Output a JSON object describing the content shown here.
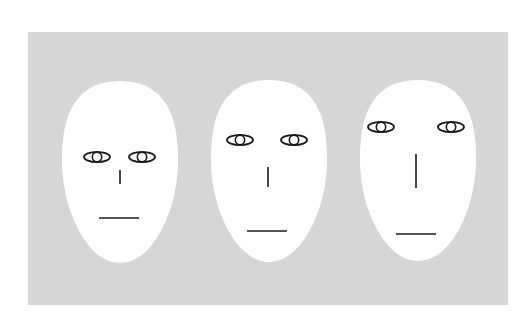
{
  "figure": {
    "background_color": "#ffffff",
    "panel": {
      "x": 28,
      "y": 32,
      "width": 480,
      "height": 273,
      "color": "#d6d6d6"
    },
    "face_color": "#ffffff",
    "stroke_color": "#1a1a1a",
    "faces": [
      {
        "id": "face-1",
        "head": {
          "cx": 120,
          "top": 81,
          "bottom": 263,
          "width": 118
        },
        "eyes": {
          "y": 157,
          "left_x": 97,
          "right_x": 142,
          "rx": 13,
          "ry": 5
        },
        "nose": {
          "x": 120,
          "y1": 170,
          "y2": 184
        },
        "mouth": {
          "y": 218,
          "x1": 99,
          "x2": 139
        }
      },
      {
        "id": "face-2",
        "head": {
          "cx": 269,
          "top": 80,
          "bottom": 262,
          "width": 118
        },
        "eyes": {
          "y": 140,
          "left_x": 240,
          "right_x": 294,
          "rx": 13,
          "ry": 5
        },
        "nose": {
          "x": 268,
          "y1": 167,
          "y2": 187
        },
        "mouth": {
          "y": 231,
          "x1": 247,
          "x2": 287
        }
      },
      {
        "id": "face-3",
        "head": {
          "cx": 418,
          "top": 80,
          "bottom": 261,
          "width": 118
        },
        "eyes": {
          "y": 127,
          "left_x": 381,
          "right_x": 451,
          "rx": 13,
          "ry": 5
        },
        "nose": {
          "x": 416,
          "y1": 154,
          "y2": 188
        },
        "mouth": {
          "y": 234,
          "x1": 396,
          "x2": 436
        }
      }
    ]
  }
}
